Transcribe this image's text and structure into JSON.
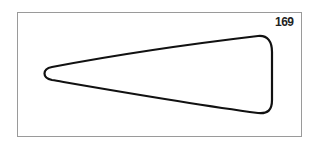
{
  "figure": {
    "label": "169",
    "shape": "elongated-rounded-triangle",
    "stroke_color": "#111111",
    "frame_color": "#9a9a9a"
  }
}
